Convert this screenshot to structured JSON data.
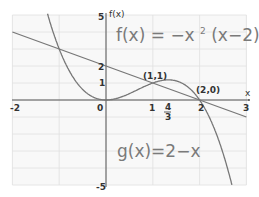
{
  "chart_data": {
    "type": "line",
    "title": "",
    "xlabel": "x",
    "ylabel": "f(x)",
    "xlim": [
      -2,
      3
    ],
    "ylim": [
      -5,
      5
    ],
    "grid": true,
    "x_tick_labels": [
      "-2",
      "0",
      "1",
      "4/3",
      "2",
      "3"
    ],
    "x_ticks": [
      -2,
      0,
      1,
      1.3333,
      2,
      3
    ],
    "y_tick_labels": [
      "5",
      "2",
      "1",
      "-5"
    ],
    "y_ticks": [
      5,
      2,
      1,
      -5
    ],
    "series": [
      {
        "name": "f(x) = -x^2 (x-2)",
        "expression": "-x^3 + 2x^2",
        "x": [
          -1.45,
          -1.25,
          -1,
          -0.75,
          -0.5,
          -0.25,
          0,
          0.25,
          0.5,
          0.75,
          1,
          1.25,
          1.3333,
          1.5,
          1.75,
          2,
          2.25,
          2.5,
          2.72
        ],
        "values": [
          7.15,
          4.08,
          3,
          1.55,
          0.625,
          0.14,
          0,
          0.11,
          0.375,
          0.7,
          1,
          1.17,
          1.185,
          1.125,
          0.77,
          0,
          -1.27,
          -3.125,
          -5
        ]
      },
      {
        "name": "g(x) = 2 - x",
        "expression": "2 - x",
        "x": [
          -2,
          3
        ],
        "values": [
          4,
          -1
        ]
      }
    ],
    "annotations": [
      {
        "text": "(1,1)",
        "x": 1,
        "y": 1
      },
      {
        "text": "(2,0)",
        "x": 2,
        "y": 0
      },
      {
        "text": "f(x) = -x² (x - 2)",
        "position": "upper-right"
      },
      {
        "text": "g(x) = 2 - x",
        "position": "lower-center"
      }
    ]
  },
  "labels": {
    "x_axis": "x",
    "y_axis": "f(x)",
    "y_top": "5",
    "y_two": "2",
    "y_one": "1",
    "y_bottom": "-5",
    "x_neg2": "-2",
    "x_zero": "0",
    "x_one": "1",
    "x_four": "4",
    "x_three_den": "3",
    "x_two": "2",
    "x_three": "3",
    "point_11": "(1,1)",
    "point_20": "(2,0)",
    "eq_f_name": "f(x)",
    "eq_f_eq": "=",
    "eq_f_minus_x": "−x",
    "eq_f_sup": "2",
    "eq_f_paren": "(x−2)",
    "eq_g": "g(x)=2−x"
  },
  "colors": {
    "curve": "#777777",
    "grid": "#e2e2e2",
    "axis": "#555555",
    "background": "#f7f7f7"
  }
}
